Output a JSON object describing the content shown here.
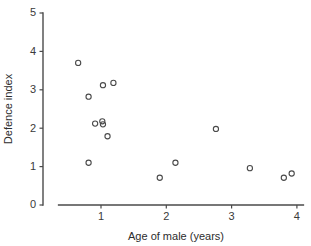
{
  "chart_data": {
    "type": "scatter",
    "title": "",
    "xlabel": "Age of male (years)",
    "ylabel": "Defence index",
    "xlim": [
      0.35,
      4.1
    ],
    "ylim": [
      0,
      5
    ],
    "xticks": [
      1,
      2,
      3,
      4
    ],
    "yticks": [
      0,
      1,
      2,
      3,
      4,
      5
    ],
    "xticklabels": [
      "1",
      "2",
      "3",
      "4"
    ],
    "yticklabels": [
      "0",
      "1",
      "2",
      "3",
      "4",
      "5"
    ],
    "grid": false,
    "legend": false,
    "marker": "open-circle",
    "marker_color": "#4a4a4a",
    "points": [
      {
        "x": 0.65,
        "y": 3.7
      },
      {
        "x": 0.81,
        "y": 2.82
      },
      {
        "x": 1.03,
        "y": 3.12
      },
      {
        "x": 1.19,
        "y": 3.18
      },
      {
        "x": 0.91,
        "y": 2.12
      },
      {
        "x": 1.02,
        "y": 2.18
      },
      {
        "x": 1.03,
        "y": 2.1
      },
      {
        "x": 1.1,
        "y": 1.79
      },
      {
        "x": 0.81,
        "y": 1.1
      },
      {
        "x": 1.9,
        "y": 0.71
      },
      {
        "x": 2.14,
        "y": 1.1
      },
      {
        "x": 2.76,
        "y": 1.98
      },
      {
        "x": 3.28,
        "y": 0.96
      },
      {
        "x": 3.8,
        "y": 0.71
      },
      {
        "x": 3.92,
        "y": 0.82
      }
    ]
  }
}
